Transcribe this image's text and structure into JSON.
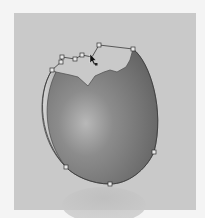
{
  "canvas": {
    "background": "#c9c9c9",
    "surround": "#f4f4f4"
  },
  "artwork": {
    "subject": "broken eggshell illustration",
    "shell_color_dark": "#6a6a6a",
    "shell_color_light": "#b4b4b4",
    "path_stroke": "#4a4a4a",
    "anchor_points": [
      {
        "x": 52,
        "y": 70
      },
      {
        "x": 61,
        "y": 62
      },
      {
        "x": 62,
        "y": 57
      },
      {
        "x": 75,
        "y": 59
      },
      {
        "x": 82,
        "y": 55
      },
      {
        "x": 99,
        "y": 45
      },
      {
        "x": 133,
        "y": 49
      },
      {
        "x": 154,
        "y": 152
      },
      {
        "x": 110,
        "y": 184
      },
      {
        "x": 66,
        "y": 167
      }
    ]
  },
  "tool": {
    "cursor": "direct-selection-arrow-icon"
  }
}
